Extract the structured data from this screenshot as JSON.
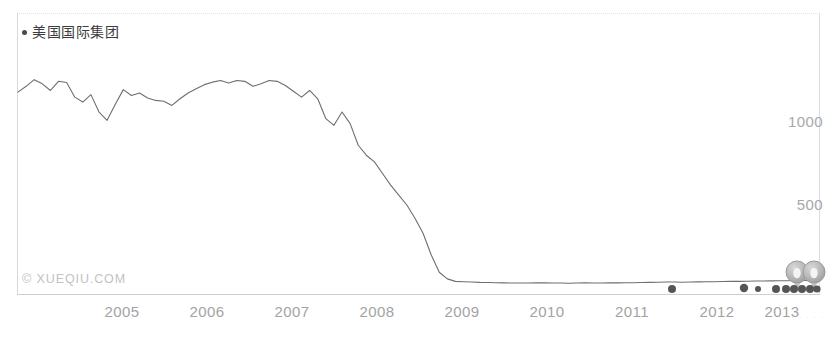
{
  "legend": {
    "marker_icon": "legend-dot-icon",
    "label": "美国国际集团"
  },
  "watermark": {
    "text": "© XUEQIU.COM"
  },
  "corner_artifact": {
    "text": "· · · · · ·"
  },
  "colors": {
    "series_line": "#6e6e6e",
    "axis_text": "#a5a5a5",
    "legend_text": "#3c3c3c",
    "watermark": "#c2c2c2",
    "frame": "#d8d8d8",
    "event_marker": "#b0b0b0",
    "data_point": "#555555"
  },
  "chart_data": {
    "type": "line",
    "title": "",
    "subtitle": "",
    "xlabel": "",
    "ylabel": "",
    "grid": false,
    "legend_position": "top-left",
    "series": [
      {
        "name": "美国国际集团",
        "color": "#6e6e6e",
        "values": [
          1180,
          1215,
          1255,
          1230,
          1190,
          1245,
          1238,
          1150,
          1120,
          1165,
          1060,
          1010,
          1105,
          1195,
          1160,
          1175,
          1145,
          1130,
          1125,
          1100,
          1140,
          1175,
          1200,
          1225,
          1240,
          1250,
          1235,
          1250,
          1245,
          1215,
          1230,
          1250,
          1245,
          1220,
          1185,
          1150,
          1190,
          1140,
          1020,
          980,
          1060,
          990,
          860,
          800,
          760,
          690,
          620,
          560,
          500,
          420,
          330,
          200,
          95,
          55,
          40,
          38,
          36,
          34,
          33,
          32,
          31,
          30,
          30,
          30,
          31,
          31,
          30,
          30,
          29,
          30,
          31,
          30,
          30,
          31,
          31,
          32,
          32,
          33,
          34,
          35,
          36,
          36,
          35,
          36,
          37,
          38,
          38,
          39,
          40,
          40,
          41,
          42,
          42,
          43,
          44,
          44,
          45,
          45,
          44,
          44
        ]
      }
    ],
    "x": {
      "tick_labels": [
        "2005",
        "2006",
        "2007",
        "2008",
        "2009",
        "2010",
        "2011",
        "2012",
        "2013"
      ],
      "tick_positions_px": [
        122,
        207,
        292,
        377,
        462,
        547,
        632,
        717,
        782
      ],
      "range": [
        "2004",
        "2013"
      ]
    },
    "y": {
      "tick_labels": [
        "1000",
        "500"
      ],
      "tick_values": [
        1000,
        500
      ],
      "tick_positions_px": [
        122,
        205
      ],
      "ylim": [
        0,
        1700
      ]
    },
    "data_points": [
      {
        "name": "marker-2011-12",
        "x_px": 672,
        "y_px": 289,
        "r": 4.0
      },
      {
        "name": "marker-2013-02",
        "x_px": 744,
        "y_px": 288,
        "r": 4.2
      },
      {
        "name": "marker-2013-04",
        "x_px": 758,
        "y_px": 289,
        "r": 3.0
      },
      {
        "name": "marker-2013-06",
        "x_px": 776,
        "y_px": 289,
        "r": 4.0
      },
      {
        "name": "marker-2013-07",
        "x_px": 786,
        "y_px": 289,
        "r": 4.0
      },
      {
        "name": "marker-2013-08",
        "x_px": 794,
        "y_px": 289,
        "r": 4.0
      },
      {
        "name": "marker-2013-09",
        "x_px": 802,
        "y_px": 289,
        "r": 4.0
      },
      {
        "name": "marker-2013-10",
        "x_px": 810,
        "y_px": 289,
        "r": 4.0
      },
      {
        "name": "marker-2013-11",
        "x_px": 817,
        "y_px": 289,
        "r": 3.6
      }
    ],
    "event_markers": [
      {
        "name": "event-balloon-left",
        "x_px": 797,
        "y_px": 272,
        "r": 11
      },
      {
        "name": "event-balloon-right",
        "x_px": 814,
        "y_px": 272,
        "r": 11
      }
    ]
  }
}
